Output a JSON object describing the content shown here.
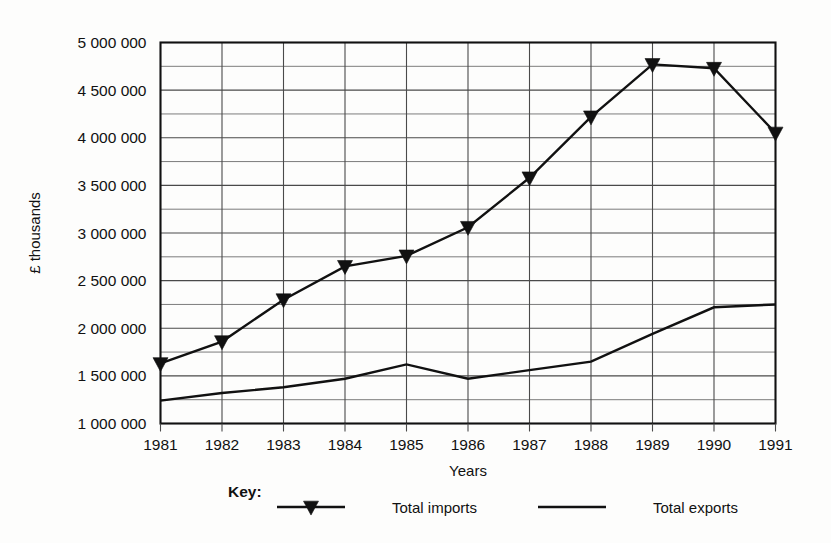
{
  "chart_data": {
    "type": "line",
    "title": "",
    "xlabel": "Years",
    "ylabel": "£ thousands",
    "categories": [
      "1981",
      "1982",
      "1983",
      "1984",
      "1985",
      "1986",
      "1987",
      "1988",
      "1989",
      "1990",
      "1991"
    ],
    "xlim": [
      1981,
      1991
    ],
    "ylim": [
      1000000,
      5000000
    ],
    "grid": true,
    "y_major_step": 500000,
    "y_minor_step": 250000,
    "y_tick_labels": [
      "5 000 000",
      "4 500 000",
      "4 000 000",
      "3 500 000",
      "3 000 000",
      "2 500 000",
      "2 000 000",
      "1 500 000",
      "1 000 000"
    ],
    "y_tick_values": [
      5000000,
      4500000,
      4000000,
      3500000,
      3000000,
      2500000,
      2000000,
      1500000,
      1000000
    ],
    "legend_position": "below",
    "legend_title": "Key:",
    "series": [
      {
        "name": "Total imports",
        "marker": "triangle-down",
        "values": [
          1630000,
          1860000,
          2300000,
          2650000,
          2760000,
          3060000,
          3580000,
          4220000,
          4770000,
          4730000,
          4050000
        ]
      },
      {
        "name": "Total exports",
        "marker": "none",
        "values": [
          1240000,
          1320000,
          1380000,
          1470000,
          1620000,
          1470000,
          1560000,
          1650000,
          1940000,
          2220000,
          2250000
        ]
      }
    ]
  },
  "axes": {
    "x_axis_title": "Years",
    "y_axis_title": "£ thousands"
  },
  "legend": {
    "title": "Key:",
    "entries": [
      {
        "label": "Total imports",
        "marker": "triangle-down-icon"
      },
      {
        "label": "Total exports",
        "marker": "line-icon"
      }
    ]
  },
  "colors": {
    "line": "#111111",
    "grid_major": "#4a4a4a",
    "grid_minor": "#6d6d6d",
    "frame": "#111111",
    "background": "#fdfdfc"
  }
}
